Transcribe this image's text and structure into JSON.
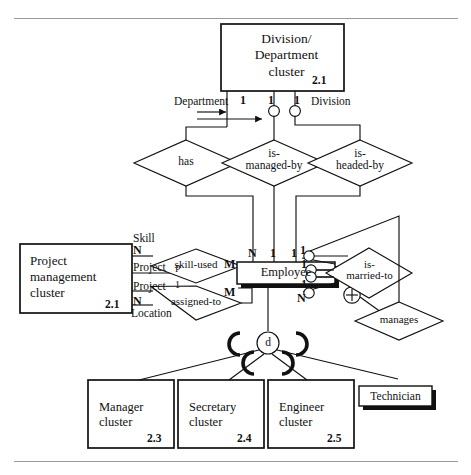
{
  "figure": {
    "type": "er-diagram",
    "title_rule_top": "",
    "title_rule_bottom": ""
  },
  "entities": [
    {
      "id": "division-department-cluster",
      "label": "Division/\nDepartment\ncluster",
      "number": "2.1",
      "style": "plain-box"
    },
    {
      "id": "project-management-cluster",
      "label": "Project\nmanagement\ncluster",
      "number": "2.1",
      "style": "plain-box"
    },
    {
      "id": "employee",
      "label": "Employee",
      "number": "",
      "style": "shadow-box"
    },
    {
      "id": "manager-cluster",
      "label": "Manager\ncluster",
      "number": "2.3",
      "style": "plain-box"
    },
    {
      "id": "secretary-cluster",
      "label": "Secretary\ncluster",
      "number": "2.4",
      "style": "plain-box"
    },
    {
      "id": "engineer-cluster",
      "label": "Engineer\ncluster",
      "number": "2.5",
      "style": "plain-box"
    },
    {
      "id": "technician",
      "label": "Technician",
      "number": "",
      "style": "shadow-box"
    }
  ],
  "relationships": [
    {
      "id": "has",
      "label": "has"
    },
    {
      "id": "is-managed-by",
      "label": "is-\nmanaged-by"
    },
    {
      "id": "is-headed-by",
      "label": "is-\nheaded-by"
    },
    {
      "id": "skill-used",
      "label": "skill-used"
    },
    {
      "id": "assigned-to",
      "label": "assigned-to"
    },
    {
      "id": "is-married-to",
      "label": "is-\nmarried-to"
    },
    {
      "id": "manages",
      "label": "manages"
    }
  ],
  "role_labels": {
    "department": "Department",
    "division": "Division",
    "skill": "Skill",
    "project_p": "Project",
    "project_p_sub": "P",
    "project_1": "Project",
    "project_1_sub": "1",
    "location": "Location"
  },
  "cardinalities": {
    "top_left_1": "1",
    "top_mid_1": "1",
    "top_right_1": "1",
    "emp_left_N": "N",
    "emp_mid_1": "1",
    "emp_right_1": "1",
    "skill_N": "N",
    "assigned_N": "N",
    "skill_used_M": "M",
    "assigned_to_M": "M",
    "married_1a": "1",
    "married_1b": "1",
    "manages_1": "1",
    "manages_N": "N"
  },
  "specialization": {
    "disjoint_symbol": "d",
    "union_symbol": "+"
  }
}
